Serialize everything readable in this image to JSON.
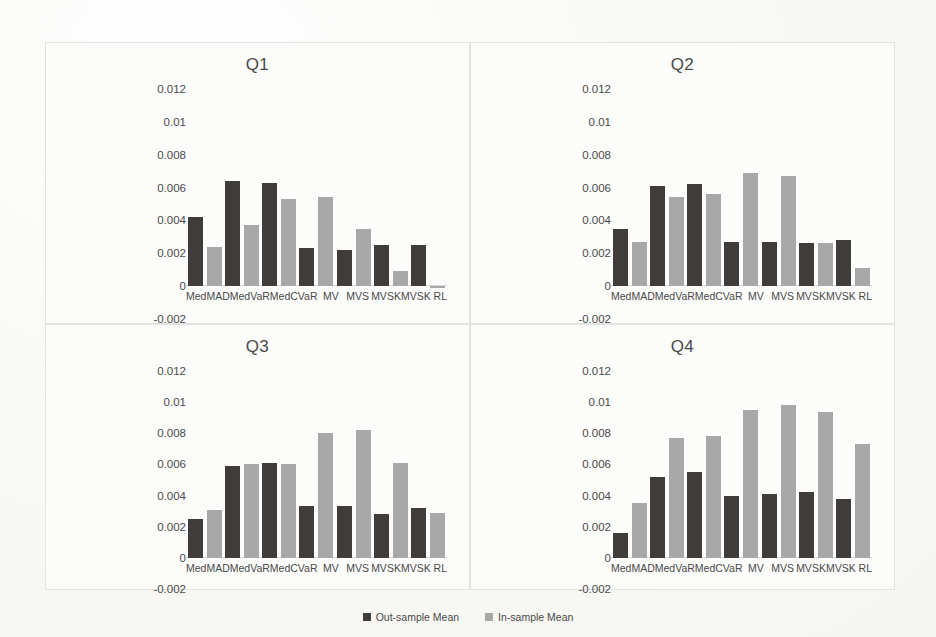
{
  "figure": {
    "background": "#fbfbf9",
    "panel_border": "#e3e3e1"
  },
  "legend": {
    "items": [
      {
        "label": "Out-sample Mean",
        "color": "#413c3c"
      },
      {
        "label": "In-sample Mean",
        "color": "#a8a8a8"
      }
    ]
  },
  "axis": {
    "ticks": [
      "0.012",
      "0.01",
      "0.008",
      "0.006",
      "0.004",
      "0.002",
      "0",
      "-0.002"
    ],
    "categories": [
      "MedMAD",
      "MedVaR",
      "MedCVaR",
      "MV",
      "MVS",
      "MVSK",
      "MVSK RL"
    ]
  },
  "chart_data": [
    {
      "type": "bar",
      "title": "Q1",
      "xlabel": "",
      "ylabel": "",
      "ylim": [
        -0.002,
        0.012
      ],
      "yticks": [
        0.012,
        0.01,
        0.008,
        0.006,
        0.004,
        0.002,
        0,
        -0.002
      ],
      "grid": false,
      "legend_position": "bottom",
      "categories": [
        "MedMAD",
        "MedVaR",
        "MedCVaR",
        "MV",
        "MVS",
        "MVSK",
        "MVSK RL"
      ],
      "series": [
        {
          "name": "Out-sample Mean",
          "color": "#413c3c",
          "values": [
            0.0042,
            0.0064,
            0.0063,
            0.0023,
            0.0022,
            0.0025,
            0.0025
          ]
        },
        {
          "name": "In-sample Mean",
          "color": "#a8a8a8",
          "values": [
            0.0024,
            0.0037,
            0.0053,
            0.0054,
            0.0035,
            0.0009,
            -0.0001
          ]
        }
      ]
    },
    {
      "type": "bar",
      "title": "Q2",
      "xlabel": "",
      "ylabel": "",
      "ylim": [
        -0.002,
        0.012
      ],
      "yticks": [
        0.012,
        0.01,
        0.008,
        0.006,
        0.004,
        0.002,
        0,
        -0.002
      ],
      "grid": false,
      "legend_position": "bottom",
      "categories": [
        "MedMAD",
        "MedVaR",
        "MedCVaR",
        "MV",
        "MVS",
        "MVSK",
        "MVSK RL"
      ],
      "series": [
        {
          "name": "Out-sample Mean",
          "color": "#413c3c",
          "values": [
            0.0035,
            0.0061,
            0.0062,
            0.0027,
            0.0027,
            0.0026,
            0.0028
          ]
        },
        {
          "name": "In-sample Mean",
          "color": "#a8a8a8",
          "values": [
            0.0027,
            0.0054,
            0.0056,
            0.0069,
            0.0067,
            0.0026,
            0.0011
          ]
        }
      ]
    },
    {
      "type": "bar",
      "title": "Q3",
      "xlabel": "",
      "ylabel": "",
      "ylim": [
        -0.002,
        0.012
      ],
      "yticks": [
        0.012,
        0.01,
        0.008,
        0.006,
        0.004,
        0.002,
        0,
        -0.002
      ],
      "grid": false,
      "legend_position": "bottom",
      "categories": [
        "MedMAD",
        "MedVaR",
        "MedCVaR",
        "MV",
        "MVS",
        "MVSK",
        "MVSK RL"
      ],
      "series": [
        {
          "name": "Out-sample Mean",
          "color": "#413c3c",
          "values": [
            0.0025,
            0.0059,
            0.0061,
            0.0033,
            0.0033,
            0.0028,
            0.0032
          ]
        },
        {
          "name": "In-sample Mean",
          "color": "#a8a8a8",
          "values": [
            0.0031,
            0.006,
            0.006,
            0.008,
            0.0082,
            0.0061,
            0.0029
          ]
        }
      ]
    },
    {
      "type": "bar",
      "title": "Q4",
      "xlabel": "",
      "ylabel": "",
      "ylim": [
        -0.002,
        0.012
      ],
      "yticks": [
        0.012,
        0.01,
        0.008,
        0.006,
        0.004,
        0.002,
        0,
        -0.002
      ],
      "grid": false,
      "legend_position": "bottom",
      "categories": [
        "MedMAD",
        "MedVaR",
        "MedCVaR",
        "MV",
        "MVS",
        "MVSK",
        "MVSK RL"
      ],
      "series": [
        {
          "name": "Out-sample Mean",
          "color": "#413c3c",
          "values": [
            0.0016,
            0.0052,
            0.0055,
            0.004,
            0.0041,
            0.0042,
            0.0038
          ]
        },
        {
          "name": "In-sample Mean",
          "color": "#a8a8a8",
          "values": [
            0.0035,
            0.0077,
            0.0078,
            0.0095,
            0.0098,
            0.0094,
            0.0073
          ]
        }
      ]
    }
  ]
}
